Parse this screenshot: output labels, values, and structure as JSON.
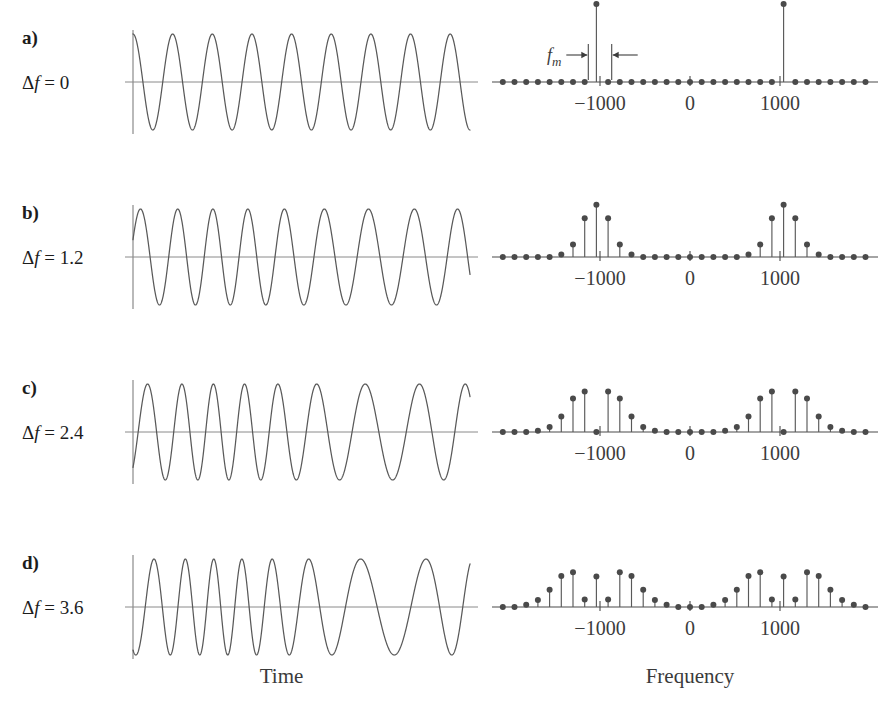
{
  "figure": {
    "time_caption": "Time",
    "frequency_caption": "Frequency",
    "line_color": "#595959",
    "dot_color": "#4a4a4a",
    "axis_color": "#8a8a8a",
    "text_color": "#1c1c1c"
  },
  "annotation": {
    "fm_symbol": "f",
    "fm_subscript": "m",
    "description": "modulation frequency spacing between adjacent spectral lines"
  },
  "panels": [
    {
      "letter": "a)",
      "delta_symbol": "Δ",
      "delta_var": "f",
      "delta_eq": "=",
      "delta_value": "0",
      "beta": 0,
      "carrier_cycles": 8.5,
      "has_fm_annotation": true
    },
    {
      "letter": "b)",
      "delta_symbol": "Δ",
      "delta_var": "f",
      "delta_eq": "=",
      "delta_value": "1.2",
      "beta": 1.2,
      "carrier_cycles": 8.5,
      "has_fm_annotation": false
    },
    {
      "letter": "c)",
      "delta_symbol": "Δ",
      "delta_var": "f",
      "delta_eq": "=",
      "delta_value": "2.4",
      "beta": 2.4,
      "carrier_cycles": 8.5,
      "has_fm_annotation": false
    },
    {
      "letter": "d)",
      "delta_symbol": "Δ",
      "delta_var": "f",
      "delta_eq": "=",
      "delta_value": "3.6",
      "beta": 3.6,
      "carrier_cycles": 8.5,
      "has_fm_annotation": false
    }
  ],
  "chart_data": {
    "type": "line",
    "xlabel": "Time / Frequency",
    "ylabel": "Amplitude",
    "time_domain": {
      "type": "line",
      "xlabel": "Time",
      "description": "Frequency-modulated carrier; instantaneous frequency varies sinusoidally as deviation increases",
      "carrier_cycles": 8.5,
      "modulation_cycles": 1.0,
      "amplitude": 1.0,
      "series": [
        {
          "name": "Δf = 0",
          "beta": 0,
          "deviation_cycles": 0
        },
        {
          "name": "Δf = 1.2",
          "beta": 1.2,
          "deviation_cycles": 1.2
        },
        {
          "name": "Δf = 2.4",
          "beta": 2.4,
          "deviation_cycles": 2.4
        },
        {
          "name": "Δf = 3.6",
          "beta": 3.6,
          "deviation_cycles": 3.6
        }
      ]
    },
    "frequency_domain": {
      "type": "bar",
      "xlabel": "Frequency",
      "ylabel": "Magnitude",
      "xticks": [
        -1000,
        0,
        1000
      ],
      "xticklabels": [
        "−1000",
        "0",
        "1000"
      ],
      "xlim": [
        -1900,
        1900
      ],
      "ylim": [
        0,
        1
      ],
      "carrier_frequency": 1000,
      "modulation_frequency": 130,
      "line_spacing_hz": 130,
      "grid": false,
      "legend": false,
      "note": "Spectral line magnitudes follow |J_n(beta)| Bessel coefficients about ±1000 Hz carrier",
      "series": [
        {
          "name": "Δf = 0",
          "beta": 0,
          "orders": [
            -6,
            -5,
            -4,
            -3,
            -2,
            -1,
            0,
            1,
            2,
            3,
            4,
            5,
            6
          ],
          "magnitudes": [
            0,
            0,
            0,
            0,
            0,
            0,
            1.0,
            0,
            0,
            0,
            0,
            0,
            0
          ]
        },
        {
          "name": "Δf = 1.2",
          "beta": 1.2,
          "orders": [
            -6,
            -5,
            -4,
            -3,
            -2,
            -1,
            0,
            1,
            2,
            3,
            4,
            5,
            6
          ],
          "magnitudes": [
            0,
            0,
            0,
            0.033,
            0.159,
            0.498,
            0.671,
            0.498,
            0.159,
            0.033,
            0,
            0,
            0
          ]
        },
        {
          "name": "Δf = 2.4",
          "beta": 2.4,
          "orders": [
            -6,
            -5,
            -4,
            -3,
            -2,
            -1,
            0,
            1,
            2,
            3,
            4,
            5,
            6
          ],
          "magnitudes": [
            0,
            0.008,
            0.064,
            0.198,
            0.431,
            0.52,
            0.003,
            0.52,
            0.431,
            0.198,
            0.064,
            0.008,
            0
          ]
        },
        {
          "name": "Δf = 3.6",
          "beta": 3.6,
          "orders": [
            -7,
            -6,
            -5,
            -4,
            -3,
            -2,
            -1,
            0,
            1,
            2,
            3,
            4,
            5,
            6,
            7
          ],
          "magnitudes": [
            0.005,
            0.025,
            0.095,
            0.255,
            0.44,
            0.458,
            0.095,
            0.398,
            0.095,
            0.458,
            0.44,
            0.255,
            0.095,
            0.025,
            0.005
          ]
        }
      ]
    }
  }
}
